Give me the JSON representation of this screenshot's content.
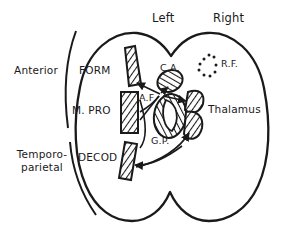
{
  "figure": {
    "type": "anatomical-schematic",
    "background_color": "#ffffff",
    "stroke_color": "#1a1a1a",
    "hatch_fill_color": "#1a1a1a"
  },
  "hemisphere_labels": [
    {
      "name": "left",
      "text": "Left",
      "x": 152,
      "y": 12
    },
    {
      "name": "right",
      "text": "Right",
      "x": 213,
      "y": 12
    }
  ],
  "cortical_regions": [
    {
      "name": "anterior",
      "text": "Anterior",
      "x": 14,
      "y": 64
    },
    {
      "name": "temporo-parietal",
      "line1": "Temporo-",
      "line2": "parietal",
      "x": 10,
      "y": 155
    }
  ],
  "processing_stages": [
    {
      "name": "form",
      "text": "FORM",
      "x": 70,
      "y": 64
    },
    {
      "name": "m-pro",
      "text": "M. PRO",
      "x": 66,
      "y": 104
    },
    {
      "name": "decod",
      "text": "DECOD",
      "x": 70,
      "y": 151
    }
  ],
  "subcortical_structures": [
    {
      "name": "c-a",
      "text": "C.A.",
      "x": 160,
      "y": 63,
      "note": "anterior commissure / caudate nucleus, hatched oval"
    },
    {
      "name": "r-f",
      "text": "R.F.",
      "x": 218,
      "y": 62,
      "note": "reticular formation, dotted circle"
    },
    {
      "name": "a-f",
      "text": "A.F.",
      "x": 138,
      "y": 94,
      "note": "arcuate fasciculus hub"
    },
    {
      "name": "g-p",
      "text": "G.P.",
      "x": 152,
      "y": 137,
      "note": "globus pallidus"
    },
    {
      "name": "thalamus",
      "text": "Thalamus",
      "x": 208,
      "y": 103
    }
  ],
  "hatched_cortical_strips": [
    {
      "name": "strip-form",
      "stage": "FORM"
    },
    {
      "name": "strip-m-pro",
      "stage": "M. PRO"
    },
    {
      "name": "strip-decod",
      "stage": "DECOD"
    }
  ],
  "braces": [
    {
      "name": "anterior-brace",
      "spans": [
        "FORM",
        "M. PRO"
      ]
    },
    {
      "name": "temporo-parietal-brace",
      "spans": [
        "DECOD"
      ]
    }
  ]
}
